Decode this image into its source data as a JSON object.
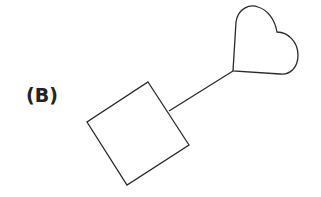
{
  "figure": {
    "panel_label": "(B)",
    "shapes": [
      {
        "type": "square",
        "rotation_deg": -33,
        "description": "rotated square"
      },
      {
        "type": "line",
        "description": "connector from square to heart"
      },
      {
        "type": "heart",
        "description": "rotated heart outline"
      }
    ],
    "stroke_color": "#2a2a2a",
    "background": "#ffffff"
  }
}
